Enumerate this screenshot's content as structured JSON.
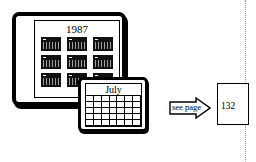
{
  "calendar_year": {
    "title": "1987",
    "months_count": 12
  },
  "calendar_month": {
    "title": "July",
    "grid_rows": 5,
    "grid_cols": 7
  },
  "reference": {
    "label": "see page",
    "page_number": "132"
  },
  "colors": {
    "ink": "#000000",
    "paper": "#ffffff",
    "dotted_rule": "#999999"
  }
}
